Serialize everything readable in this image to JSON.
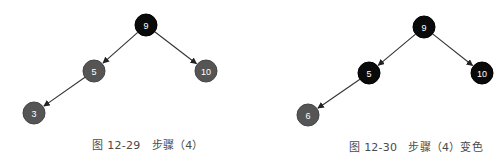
{
  "colors": {
    "black_node": "#0a0a0a",
    "red_node": "#555555",
    "edge": "#333333",
    "caption": "#4a4a4a"
  },
  "figures": [
    {
      "caption": "图 12-29　步骤（4）",
      "caption_pos": {
        "x": 148,
        "y": 143
      },
      "nodes": [
        {
          "id": "n9",
          "label": "9",
          "color": "black",
          "x": 146,
          "y": 25
        },
        {
          "id": "n5",
          "label": "5",
          "color": "red",
          "x": 94,
          "y": 71
        },
        {
          "id": "n10",
          "label": "10",
          "color": "red",
          "x": 206,
          "y": 71
        },
        {
          "id": "n3",
          "label": "3",
          "color": "red",
          "x": 34,
          "y": 113
        }
      ],
      "edges": [
        [
          "n9",
          "n5"
        ],
        [
          "n9",
          "n10"
        ],
        [
          "n5",
          "n3"
        ]
      ]
    },
    {
      "caption": "图 12-30　步骤（4）变色",
      "caption_pos": {
        "x": 416,
        "y": 145
      },
      "nodes": [
        {
          "id": "m9",
          "label": "9",
          "color": "black",
          "x": 424,
          "y": 27
        },
        {
          "id": "m5",
          "label": "5",
          "color": "black",
          "x": 369,
          "y": 73
        },
        {
          "id": "m10",
          "label": "10",
          "color": "black",
          "x": 482,
          "y": 73
        },
        {
          "id": "m6",
          "label": "6",
          "color": "red",
          "x": 308,
          "y": 115
        }
      ],
      "edges": [
        [
          "m9",
          "m5"
        ],
        [
          "m9",
          "m10"
        ],
        [
          "m5",
          "m6"
        ]
      ]
    }
  ]
}
